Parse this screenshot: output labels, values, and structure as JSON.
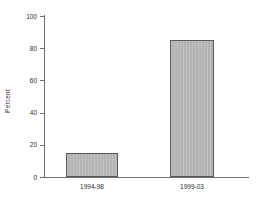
{
  "chart_data": {
    "type": "bar",
    "title": "",
    "subtitle": "",
    "xlabel": "",
    "ylabel": "Percent",
    "categories": [
      "1994-98",
      "1999-03"
    ],
    "values": [
      15,
      85
    ],
    "series": [
      {
        "name": "Percent",
        "values": [
          15,
          85
        ]
      }
    ],
    "ylim": [
      0,
      100
    ],
    "yticks": [
      0,
      20,
      40,
      60,
      80,
      100
    ],
    "ytick_labels": [
      "0",
      "20",
      "40",
      "60",
      "80",
      "100"
    ],
    "grid": false,
    "legend": false,
    "legend_position": "none",
    "annotations": [],
    "bar_fill_color": "#b7b7b7",
    "bar_border_color": "#5a5a5a",
    "axis_color": "#6e6e6e",
    "background_color": "#ffffff",
    "text_color": "#2d2d2d"
  }
}
